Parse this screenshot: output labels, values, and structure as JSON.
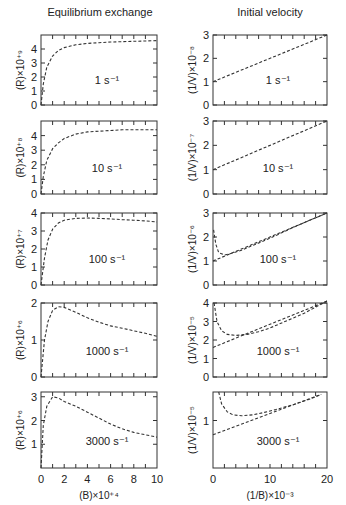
{
  "columns": [
    {
      "title": "Equilibrium exchange",
      "xlabel": "(B)×10⁺⁴",
      "xticks": [
        "0",
        "2",
        "4",
        "6",
        "8",
        "10"
      ],
      "xmax": 10
    },
    {
      "title": "Initial velocity",
      "xlabel": "(1/B)×10⁻³",
      "xticks": [
        "0",
        "10",
        "20"
      ],
      "xmax": 20
    }
  ],
  "chart_data": [
    {
      "type": "line",
      "title": "Equilibrium exchange, 1 s⁻¹",
      "ylabel": "(R)×10⁺⁹",
      "xlabel": "(B)×10⁺⁴",
      "ylim": [
        0,
        5
      ],
      "yticks": [
        0,
        1,
        2,
        3,
        4
      ],
      "annotation": "1 s⁻¹",
      "x": [
        0,
        0.2,
        0.5,
        1,
        1.5,
        2,
        3,
        4,
        5,
        6,
        7,
        8,
        9,
        10
      ],
      "values": [
        0,
        1.5,
        2.7,
        3.5,
        3.9,
        4.1,
        4.3,
        4.4,
        4.45,
        4.5,
        4.52,
        4.55,
        4.57,
        4.6
      ]
    },
    {
      "type": "line",
      "title": "Initial velocity, 1 s⁻¹",
      "ylabel": "(1/V)×10⁻⁸",
      "xlabel": "(1/B)×10⁻³",
      "ylim": [
        0,
        3
      ],
      "yticks": [
        0,
        1,
        2,
        3
      ],
      "annotation": "1 s⁻¹",
      "x": [
        0,
        20
      ],
      "values": [
        1.0,
        3.0
      ]
    },
    {
      "type": "line",
      "title": "Equilibrium exchange, 10 s⁻¹",
      "ylabel": "(R)×10⁺⁸",
      "xlabel": "(B)×10⁺⁴",
      "ylim": [
        0,
        5
      ],
      "yticks": [
        0,
        1,
        2,
        3,
        4
      ],
      "annotation": "10 s⁻¹",
      "x": [
        0,
        0.2,
        0.5,
        1,
        1.5,
        2,
        3,
        4,
        5,
        6,
        7,
        8,
        9,
        10
      ],
      "values": [
        0,
        1.2,
        2.3,
        3.1,
        3.5,
        3.8,
        4.1,
        4.25,
        4.3,
        4.35,
        4.4,
        4.4,
        4.4,
        4.4
      ]
    },
    {
      "type": "line",
      "title": "Initial velocity, 10 s⁻¹",
      "ylabel": "(1/V)×10⁻⁷",
      "xlabel": "(1/B)×10⁻³",
      "ylim": [
        0,
        3
      ],
      "yticks": [
        0,
        1,
        2,
        3
      ],
      "annotation": "10 s⁻¹",
      "x": [
        0,
        20
      ],
      "values": [
        1.0,
        3.0
      ]
    },
    {
      "type": "line",
      "title": "Equilibrium exchange, 100 s⁻¹",
      "ylabel": "(R)×10⁺⁷",
      "xlabel": "(B)×10⁺⁴",
      "ylim": [
        0,
        4
      ],
      "yticks": [
        0,
        1,
        2,
        3,
        4
      ],
      "annotation": "100 s⁻¹",
      "x": [
        0,
        0.3,
        0.6,
        1,
        1.5,
        2,
        3,
        4,
        5,
        6,
        7,
        8,
        9,
        10
      ],
      "values": [
        0,
        1.5,
        2.5,
        3.1,
        3.45,
        3.6,
        3.7,
        3.72,
        3.7,
        3.67,
        3.63,
        3.6,
        3.56,
        3.5
      ]
    },
    {
      "type": "line",
      "title": "Initial velocity, 100 s⁻¹",
      "ylabel": "(1/V)×10⁻⁶",
      "xlabel": "(1/B)×10⁻³",
      "ylim": [
        0,
        3
      ],
      "yticks": [
        0,
        1,
        2,
        3
      ],
      "annotation": "100 s⁻¹",
      "series": [
        {
          "name": "linear",
          "x": [
            0,
            20
          ],
          "values": [
            1.0,
            3.0
          ]
        },
        {
          "name": "curve",
          "x": [
            0.1,
            0.5,
            1,
            2,
            3,
            5,
            7,
            10,
            15,
            20
          ],
          "values": [
            2.3,
            1.7,
            1.35,
            1.25,
            1.3,
            1.45,
            1.65,
            1.95,
            2.5,
            3.0
          ]
        }
      ]
    },
    {
      "type": "line",
      "title": "Equilibrium exchange, 1000 s⁻¹",
      "ylabel": "(R)×10⁺⁶",
      "xlabel": "(B)×10⁺⁴",
      "ylim": [
        0,
        2
      ],
      "yticks": [
        0,
        1,
        2
      ],
      "annotation": "1000 s⁻¹",
      "x": [
        0,
        0.3,
        0.6,
        1,
        1.5,
        2,
        3,
        4,
        5,
        6,
        7,
        8,
        9,
        10
      ],
      "values": [
        0,
        1.0,
        1.5,
        1.8,
        1.9,
        1.88,
        1.75,
        1.6,
        1.48,
        1.38,
        1.32,
        1.25,
        1.18,
        1.1
      ]
    },
    {
      "type": "line",
      "title": "Initial velocity, 1000 s⁻¹",
      "ylabel": "(1/V)×10⁻⁵",
      "xlabel": "(1/B)×10⁻³",
      "ylim": [
        0,
        4
      ],
      "yticks": [
        0,
        1,
        2,
        3,
        4
      ],
      "annotation": "1000 s⁻¹",
      "series": [
        {
          "name": "linear",
          "x": [
            0,
            20
          ],
          "values": [
            1.6,
            4.1
          ]
        },
        {
          "name": "curve",
          "x": [
            0.2,
            0.7,
            1.5,
            2.5,
            4,
            6,
            8,
            10,
            13,
            16,
            20
          ],
          "values": [
            4.0,
            3.0,
            2.5,
            2.3,
            2.25,
            2.3,
            2.45,
            2.65,
            3.05,
            3.45,
            4.1
          ]
        }
      ]
    },
    {
      "type": "line",
      "title": "Equilibrium exchange, 3000 s⁻¹",
      "ylabel": "(R)×10⁺⁶",
      "xlabel": "(B)×10⁺⁴",
      "ylim": [
        0,
        3.2
      ],
      "yticks": [
        1,
        2,
        3
      ],
      "annotation": "3000 s⁻¹",
      "x": [
        0,
        0.2,
        0.5,
        1,
        1.5,
        2,
        3,
        4,
        5,
        6,
        7,
        8,
        9,
        10
      ],
      "values": [
        0,
        1.8,
        2.6,
        3.0,
        2.95,
        2.8,
        2.6,
        2.35,
        2.1,
        1.85,
        1.65,
        1.5,
        1.4,
        1.3
      ]
    },
    {
      "type": "line",
      "title": "Initial velocity, 3000 s⁻¹",
      "ylabel": "(1/V)×10⁻⁵",
      "xlabel": "(1/B)×10⁻³",
      "ylim": [
        0,
        1.6
      ],
      "yticks": [
        1
      ],
      "annotation": "3000 s⁻¹",
      "series": [
        {
          "name": "linear",
          "x": [
            0,
            19
          ],
          "values": [
            0.7,
            1.55
          ]
        },
        {
          "name": "curve",
          "x": [
            1,
            1.5,
            2.5,
            3.5,
            5,
            7,
            9,
            11,
            14,
            17,
            19
          ],
          "values": [
            1.6,
            1.35,
            1.18,
            1.12,
            1.1,
            1.12,
            1.17,
            1.23,
            1.33,
            1.45,
            1.55
          ]
        }
      ]
    }
  ]
}
